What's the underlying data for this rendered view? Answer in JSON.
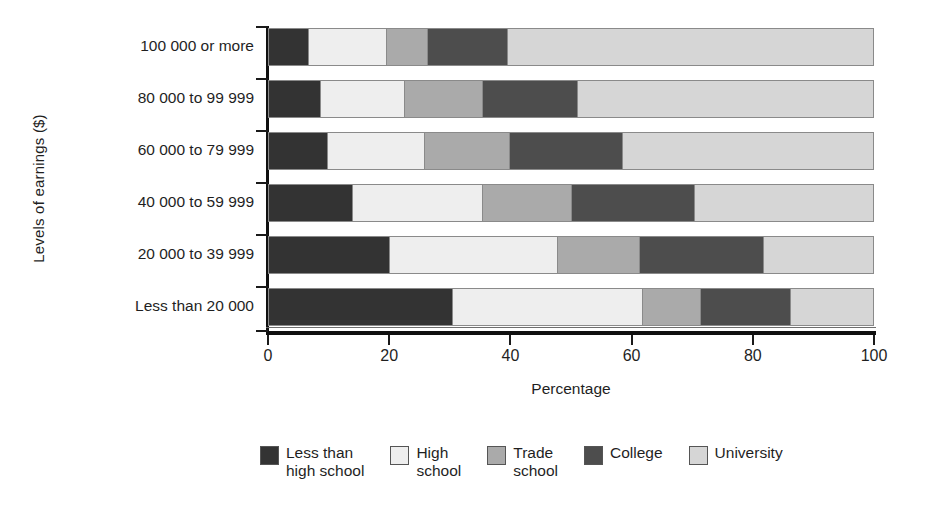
{
  "chart_data": {
    "type": "bar",
    "orientation": "horizontal",
    "stacked": true,
    "stacked_100pct": true,
    "title": "",
    "xlabel": "Percentage",
    "ylabel": "Levels of earnings ($)",
    "xlim": [
      0,
      100
    ],
    "xticks": [
      0,
      20,
      40,
      60,
      80,
      100
    ],
    "xtick_labels": [
      "0",
      "20",
      "40",
      "60",
      "80",
      "100"
    ],
    "grid": false,
    "legend_position": "bottom",
    "categories": [
      "100 000 or more",
      "80 000 to 99 999",
      "60 000 to 79 999",
      "40 000 to 59 999",
      "20 000 to 39 999",
      "Less than 20 000"
    ],
    "series": [
      {
        "name": "Less than\nhigh school",
        "legend_label": "Less than\nhigh school",
        "color": "#333333",
        "values": [
          6.6,
          8.6,
          9.7,
          13.9,
          20.0,
          30.5
        ]
      },
      {
        "name": "High\nschool",
        "legend_label": "High\nschool",
        "color": "#eeeeee",
        "values": [
          12.9,
          14.0,
          16.2,
          21.6,
          27.9,
          31.4
        ]
      },
      {
        "name": "Trade\nschool",
        "legend_label": "Trade\nschool",
        "color": "#aaaaaa",
        "values": [
          6.9,
          12.9,
          14.0,
          14.7,
          13.5,
          9.7
        ]
      },
      {
        "name": "College",
        "legend_label": "College",
        "color": "#4d4d4d",
        "values": [
          13.2,
          15.7,
          18.7,
          20.3,
          20.6,
          14.9
        ]
      },
      {
        "name": "University",
        "legend_label": "University",
        "color": "#d6d6d6",
        "values": [
          60.4,
          48.8,
          41.4,
          29.5,
          18.0,
          13.5
        ]
      }
    ],
    "cumulative_boundaries": [
      [
        6.6,
        19.5,
        26.4,
        39.6,
        100.0
      ],
      [
        8.6,
        22.6,
        35.5,
        51.2,
        100.0
      ],
      [
        9.7,
        25.9,
        39.9,
        58.6,
        100.0
      ],
      [
        13.9,
        35.5,
        50.2,
        70.5,
        100.0
      ],
      [
        20.0,
        47.9,
        61.4,
        82.0,
        100.0
      ],
      [
        30.5,
        61.9,
        71.6,
        86.5,
        100.0
      ]
    ]
  },
  "colors": {
    "axis": "#101010",
    "text": "#1f1f1f",
    "background": "#ffffff",
    "segment_border": "#8a8a8a"
  }
}
